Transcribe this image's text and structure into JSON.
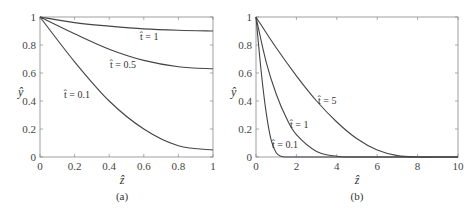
{
  "chart_data": [
    {
      "panel": "(a)",
      "type": "line",
      "title": "",
      "xlabel": "ẑ",
      "ylabel": "ŷ",
      "xlim": [
        0,
        1
      ],
      "ylim": [
        0,
        1
      ],
      "xticks": [
        "0",
        "0.2",
        "0.4",
        "0.6",
        "0.8",
        "1"
      ],
      "yticks": [
        "0",
        "0.2",
        "0.4",
        "0.6",
        "0.8",
        "1"
      ],
      "grid": false,
      "legend": "inline annotations",
      "series": [
        {
          "name": "t̂ = 1",
          "x": [
            0,
            0.2,
            0.4,
            0.6,
            0.8,
            1.0
          ],
          "y": [
            1.0,
            0.96,
            0.935,
            0.915,
            0.905,
            0.9
          ]
        },
        {
          "name": "t̂ = 0.5",
          "x": [
            0,
            0.2,
            0.4,
            0.6,
            0.8,
            1.0
          ],
          "y": [
            1.0,
            0.88,
            0.77,
            0.69,
            0.645,
            0.63
          ]
        },
        {
          "name": "t̂ = 0.1",
          "x": [
            0,
            0.2,
            0.4,
            0.6,
            0.8,
            1.0
          ],
          "y": [
            1.0,
            0.68,
            0.4,
            0.2,
            0.08,
            0.05
          ]
        }
      ],
      "annotations": [
        "t̂ = 1",
        "t̂ = 0.5",
        "t̂ = 0.1"
      ],
      "caption": "(a)"
    },
    {
      "panel": "(b)",
      "type": "line",
      "title": "",
      "xlabel": "ẑ",
      "ylabel": "ŷ",
      "xlim": [
        0,
        10
      ],
      "ylim": [
        0,
        1
      ],
      "xticks": [
        "0",
        "2",
        "4",
        "6",
        "8",
        "10"
      ],
      "yticks": [
        "0",
        "0.2",
        "0.4",
        "0.6",
        "0.8",
        "1"
      ],
      "grid": false,
      "legend": "inline annotations",
      "series": [
        {
          "name": "t̂ = 5",
          "x": [
            0,
            1,
            2,
            3,
            4,
            5,
            6,
            7,
            8,
            9
          ],
          "y": [
            1.0,
            0.78,
            0.58,
            0.4,
            0.25,
            0.13,
            0.05,
            0.01,
            0.0,
            0.0
          ]
        },
        {
          "name": "t̂ = 1",
          "x": [
            0,
            0.5,
            1,
            1.5,
            2,
            3,
            4,
            4.5
          ],
          "y": [
            1.0,
            0.68,
            0.45,
            0.28,
            0.16,
            0.04,
            0.005,
            0.0
          ]
        },
        {
          "name": "t̂ = 0.1",
          "x": [
            0,
            0.25,
            0.5,
            0.75,
            1,
            1.25,
            1.5
          ],
          "y": [
            1.0,
            0.62,
            0.32,
            0.12,
            0.03,
            0.005,
            0.0
          ]
        }
      ],
      "annotations": [
        "t̂ = 5",
        "t̂ = 1",
        "t̂ = 0.1"
      ],
      "caption": "(b)"
    }
  ]
}
